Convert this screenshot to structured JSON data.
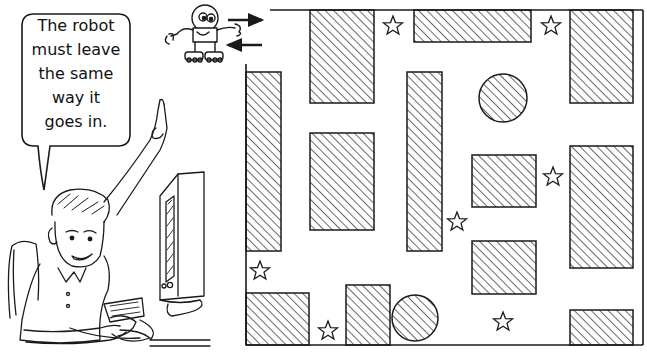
{
  "speech_bubble": {
    "lines": [
      "The robot",
      "must leave",
      "the same",
      "way it",
      "goes in."
    ]
  },
  "maze": {
    "colors": {
      "line": "#1a1a1a",
      "hatch": "#1a1a1a",
      "background": "#ffffff"
    },
    "walls": [
      {
        "x1": 270,
        "y1": 10,
        "x2": 643,
        "y2": 10
      },
      {
        "x1": 643,
        "y1": 10,
        "x2": 643,
        "y2": 345
      },
      {
        "x1": 246,
        "y1": 345,
        "x2": 643,
        "y2": 345
      },
      {
        "x1": 246,
        "y1": 64,
        "x2": 246,
        "y2": 345
      }
    ],
    "blocks": [
      {
        "x": 310,
        "y": 10,
        "w": 64,
        "h": 93
      },
      {
        "x": 414,
        "y": 10,
        "w": 117,
        "h": 32
      },
      {
        "x": 570,
        "y": 10,
        "w": 63,
        "h": 93
      },
      {
        "x": 246,
        "y": 72,
        "w": 35,
        "h": 179
      },
      {
        "x": 310,
        "y": 133,
        "w": 64,
        "h": 97
      },
      {
        "x": 407,
        "y": 72,
        "w": 35,
        "h": 179
      },
      {
        "x": 472,
        "y": 155,
        "w": 64,
        "h": 52
      },
      {
        "x": 570,
        "y": 146,
        "w": 63,
        "h": 122
      },
      {
        "x": 472,
        "y": 241,
        "w": 64,
        "h": 53
      },
      {
        "x": 246,
        "y": 293,
        "w": 63,
        "h": 52
      },
      {
        "x": 346,
        "y": 285,
        "w": 44,
        "h": 60
      },
      {
        "x": 570,
        "y": 310,
        "w": 63,
        "h": 35
      }
    ],
    "circles": [
      {
        "cx": 503,
        "cy": 98,
        "r": 24
      },
      {
        "cx": 415,
        "cy": 318,
        "r": 23
      }
    ],
    "stars": [
      {
        "cx": 393,
        "cy": 26
      },
      {
        "cx": 551,
        "cy": 26
      },
      {
        "cx": 553,
        "cy": 177
      },
      {
        "cx": 457,
        "cy": 222
      },
      {
        "cx": 260,
        "cy": 271
      },
      {
        "cx": 328,
        "cy": 331
      },
      {
        "cx": 503,
        "cy": 322
      }
    ],
    "arrows": [
      {
        "direction": "right",
        "x1": 228,
        "y1": 20,
        "x2": 262,
        "y2": 20
      },
      {
        "direction": "left",
        "x1": 262,
        "y1": 45,
        "x2": 228,
        "y2": 45
      }
    ]
  },
  "robot": {
    "label": "robot"
  },
  "boy": {
    "label": "boy at computer pointing up"
  }
}
